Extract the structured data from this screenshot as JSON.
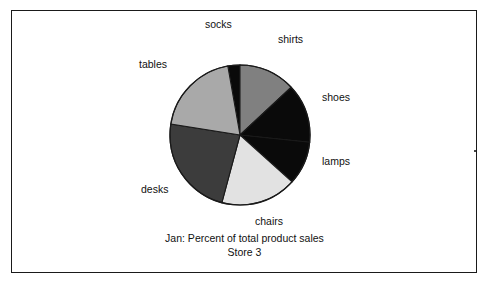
{
  "figure": {
    "caption_line1": "Jan: Percent of total product sales",
    "caption_line2": "Store 3"
  },
  "colors": {
    "socks": "#0a0a0a",
    "shirts": "#808080",
    "shoes": "#0a0a0a",
    "lamps": "#0a0a0a",
    "chairs": "#e2e2e2",
    "desks": "#3c3c3c",
    "tables": "#a9a9a9",
    "outline": "#1a1a1a",
    "text": "#111111",
    "background": "#ffffff"
  },
  "labels": {
    "socks": "socks",
    "shirts": "shirts",
    "shoes": "shoes",
    "lamps": "lamps",
    "chairs": "chairs",
    "desks": "desks",
    "tables": "tables"
  },
  "chart_data": {
    "type": "pie",
    "title": "Jan: Percent of total product sales",
    "subtitle": "Store 3",
    "xlabel": "",
    "ylabel": "",
    "grid": false,
    "legend": "none",
    "labels_position": "outside",
    "start_angle_deg_clockwise_from_top": 350,
    "center_px": [
      240,
      135
    ],
    "radius_px": 70,
    "categories": [
      "socks",
      "shirts",
      "shoes",
      "lamps",
      "chairs",
      "desks",
      "tables"
    ],
    "values": [
      2.8,
      13.1,
      13.6,
      10.0,
      17.5,
      23.3,
      19.7
    ],
    "units": "percent",
    "slices": [
      {
        "label": "socks",
        "value": 2.8,
        "color": "#0a0a0a",
        "start_deg": 350,
        "end_deg": 360
      },
      {
        "label": "shirts",
        "value": 13.1,
        "color": "#808080",
        "start_deg": 0,
        "end_deg": 47
      },
      {
        "label": "shoes",
        "value": 13.6,
        "color": "#0a0a0a",
        "start_deg": 47,
        "end_deg": 96
      },
      {
        "label": "lamps",
        "value": 10.0,
        "color": "#0a0a0a",
        "start_deg": 96,
        "end_deg": 132
      },
      {
        "label": "chairs",
        "value": 17.5,
        "color": "#e2e2e2",
        "start_deg": 132,
        "end_deg": 195
      },
      {
        "label": "desks",
        "value": 23.3,
        "color": "#3c3c3c",
        "start_deg": 195,
        "end_deg": 279
      },
      {
        "label": "tables",
        "value": 19.7,
        "color": "#a9a9a9",
        "start_deg": 279,
        "end_deg": 350
      }
    ]
  },
  "label_positions": {
    "socks": {
      "left": 205,
      "top": 18
    },
    "shirts": {
      "left": 278,
      "top": 33
    },
    "shoes": {
      "left": 322,
      "top": 91
    },
    "lamps": {
      "left": 322,
      "top": 155
    },
    "chairs": {
      "left": 255,
      "top": 215
    },
    "desks": {
      "left": 141,
      "top": 183
    },
    "tables": {
      "left": 139,
      "top": 58
    }
  }
}
